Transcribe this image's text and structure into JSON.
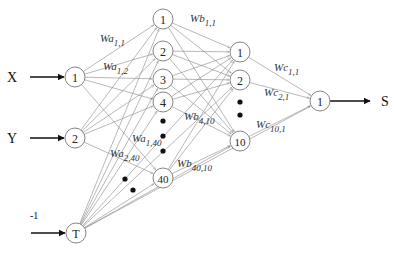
{
  "diagram": {
    "type": "neural-network",
    "inputs": [
      {
        "id": "in1",
        "node_label": "1",
        "signal_label": "X",
        "x": 75,
        "y": 77
      },
      {
        "id": "in2",
        "node_label": "2",
        "signal_label": "Y",
        "x": 75,
        "y": 138
      },
      {
        "id": "bias",
        "node_label": "T",
        "signal_label": "-1",
        "x": 76,
        "y": 233
      }
    ],
    "hidden_a": [
      {
        "node_label": "1",
        "x": 163,
        "y": 19
      },
      {
        "node_label": "2",
        "x": 163,
        "y": 51
      },
      {
        "node_label": "3",
        "x": 163,
        "y": 79
      },
      {
        "node_label": "4",
        "x": 163,
        "y": 102
      },
      {
        "node_label": "40",
        "x": 163,
        "y": 178
      }
    ],
    "hidden_b": [
      {
        "node_label": "1",
        "x": 240,
        "y": 52
      },
      {
        "node_label": "2",
        "x": 240,
        "y": 80
      },
      {
        "node_label": "10",
        "x": 240,
        "y": 141
      }
    ],
    "output": {
      "node_label": "1",
      "signal_label": "S",
      "x": 320,
      "y": 101
    },
    "weight_labels": [
      {
        "base": "Wa",
        "sub": "1,1",
        "x": 100,
        "y": 42
      },
      {
        "base": "Wa",
        "sub": "1,2",
        "x": 103,
        "y": 70
      },
      {
        "base": "Wb",
        "sub": "1,1",
        "x": 190,
        "y": 22
      },
      {
        "base": "Wc",
        "sub": "1,1",
        "x": 274,
        "y": 71
      },
      {
        "base": "Wc",
        "sub": "2,1",
        "x": 264,
        "y": 96
      },
      {
        "base": "Wb",
        "sub": "4,10",
        "x": 184,
        "y": 120
      },
      {
        "base": "Wa",
        "sub": "1,40",
        "x": 132,
        "y": 142
      },
      {
        "base": "Wa",
        "sub": "2,40",
        "x": 110,
        "y": 157
      },
      {
        "base": "Wb",
        "sub": "40,10",
        "x": 177,
        "y": 167
      },
      {
        "base": "Wc",
        "sub": "10,1",
        "x": 256,
        "y": 128
      }
    ]
  }
}
